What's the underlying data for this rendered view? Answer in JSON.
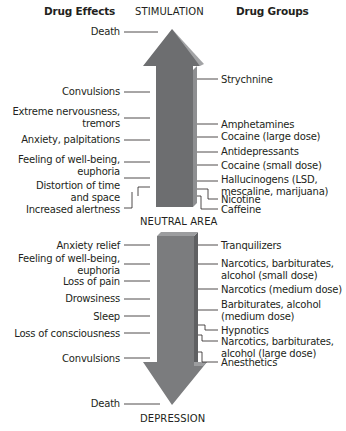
{
  "headers": {
    "left": "Drug Effects",
    "center_top": "STIMULATION",
    "right": "Drug Groups",
    "center_mid": "NEUTRAL AREA",
    "center_bottom": "DEPRESSION"
  },
  "colors": {
    "arrow_front": "#6d6e70",
    "arrow_side": "#8e8f91",
    "arrow_lower_front": "#7b7c7e",
    "line": "#231f20",
    "text": "#231f20"
  },
  "stimulation": {
    "effects": [
      "Death",
      "Convulsions",
      "Extreme nervousness,",
      "tremors",
      "Anxiety, palpitations",
      "Feeling of well-being,",
      "euphoria",
      "Distortion of time",
      "and space",
      "Increased alertness"
    ],
    "groups": [
      "Strychnine",
      "Amphetamines",
      "Cocaine (large dose)",
      "Antidepressants",
      "Cocaine (small dose)",
      "Hallucinogens (LSD,",
      "mescaline, marijuana)",
      "Nicotine",
      "Caffeine"
    ]
  },
  "depression": {
    "effects": [
      "Anxiety relief",
      "Feeling of well-being,",
      "euphoria",
      "Loss of pain",
      "Drowsiness",
      "Sleep",
      "Loss of consciousness",
      "Convulsions",
      "Death"
    ],
    "groups": [
      "Tranquilizers",
      "Narcotics, barbiturates,",
      "alcohol (small dose)",
      "Narcotics (medium dose)",
      "Barbiturates, alcohol",
      "(medium dose)",
      "Hypnotics",
      "Narcotics, barbiturates,",
      "alcohol (large dose)",
      "Anesthetics"
    ]
  }
}
